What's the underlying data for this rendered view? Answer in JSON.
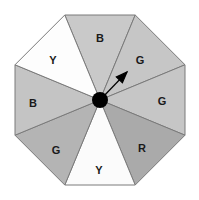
{
  "figure": {
    "name": "octagonal-spinner",
    "background_color": "#ffffff",
    "outline_color": "#7a7a7a",
    "center_x": 100,
    "center_y": 100,
    "radius": 92,
    "sides": 8
  },
  "chart_data": {
    "type": "pie",
    "title": "",
    "subtitle": "",
    "xlabel": "",
    "ylabel": "",
    "legend_position": "none",
    "grid": false,
    "categories": [
      "B",
      "G",
      "G",
      "R",
      "Y",
      "G",
      "B",
      "Y"
    ],
    "values": [
      1,
      1,
      1,
      1,
      1,
      1,
      1,
      1
    ],
    "annotations": [
      "arrow points to upper-right G sector"
    ],
    "sectors": [
      {
        "index": 0,
        "label": "B",
        "position": "top",
        "fill": "#c9c9c9",
        "start_angle": -112.5,
        "end_angle": -67.5,
        "label_x": 100,
        "label_y": 38
      },
      {
        "index": 1,
        "label": "G",
        "position": "top-right",
        "fill": "#c6c6c6",
        "start_angle": -67.5,
        "end_angle": -22.5,
        "label_x": 140,
        "label_y": 60
      },
      {
        "index": 2,
        "label": "G",
        "position": "right",
        "fill": "#c6c6c6",
        "start_angle": -22.5,
        "end_angle": 22.5,
        "label_x": 162,
        "label_y": 101
      },
      {
        "index": 3,
        "label": "R",
        "position": "bottom-right",
        "fill": "#aaaaaa",
        "start_angle": 22.5,
        "end_angle": 67.5,
        "label_x": 142,
        "label_y": 148
      },
      {
        "index": 4,
        "label": "Y",
        "position": "bottom",
        "fill": "#fbfbfb",
        "start_angle": 67.5,
        "end_angle": 112.5,
        "label_x": 99,
        "label_y": 170
      },
      {
        "index": 5,
        "label": "G",
        "position": "bottom-left",
        "fill": "#b4b4b4",
        "start_angle": 112.5,
        "end_angle": 157.5,
        "label_x": 56,
        "label_y": 150
      },
      {
        "index": 6,
        "label": "B",
        "position": "left",
        "fill": "#c4c4c4",
        "start_angle": 157.5,
        "end_angle": 202.5,
        "label_x": 33,
        "label_y": 103
      },
      {
        "index": 7,
        "label": "Y",
        "position": "top-left",
        "fill": "#fdfdfd",
        "start_angle": 202.5,
        "end_angle": 247.5,
        "label_x": 53,
        "label_y": 60
      }
    ],
    "hub": {
      "color": "#000000",
      "radius": 8,
      "cx": 100,
      "cy": 100
    },
    "pointer": {
      "color": "#000000",
      "from_x": 100,
      "from_y": 100,
      "to_x": 127,
      "to_y": 72,
      "angle_degrees": 46
    }
  }
}
